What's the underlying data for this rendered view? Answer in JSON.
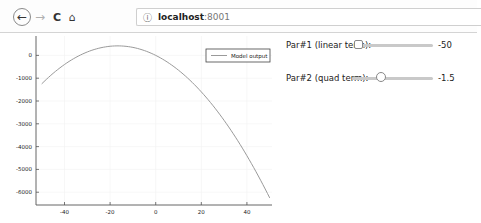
{
  "browser": {
    "url_host": "localhost",
    "url_port": ":8001",
    "icons": {
      "back": "←",
      "forward": "→",
      "reload": "C",
      "home": "⌂",
      "info": "ⓘ"
    }
  },
  "controls": [
    {
      "label": "Par#1 (linear term):",
      "value": "-50",
      "thumb_pos": 0.0
    },
    {
      "label": "Par#2 (quad term):",
      "value": "-1.5",
      "thumb_pos": 0.43
    }
  ],
  "chart_data": {
    "type": "line",
    "title": "",
    "xlabel": "",
    "ylabel": "",
    "xlim": [
      -52.5,
      51
    ],
    "ylim": [
      -6560,
      850
    ],
    "x_ticks": [
      -40,
      -20,
      0,
      20,
      40
    ],
    "x_tick_labels": [
      "-40",
      "-20",
      "0",
      "20",
      "40"
    ],
    "y_ticks": [
      0,
      -1000,
      -2000,
      -3000,
      -4000,
      -5000,
      -6000
    ],
    "y_tick_labels": [
      "0",
      "-1000",
      "-2000",
      "-3000",
      "-4000",
      "-5000",
      "-6000"
    ],
    "grid": true,
    "legend_position": "upper right",
    "series": [
      {
        "name": "Model output",
        "color": "#9a9a9a",
        "formula": "y = -1.5*x^2 - 50*x",
        "x": [
          -50,
          -40,
          -30,
          -20,
          -16.67,
          -10,
          0,
          10,
          20,
          30,
          40,
          50
        ],
        "y": [
          -1250,
          -400,
          150,
          400,
          416.7,
          350,
          0,
          -650,
          -1600,
          -2850,
          -4400,
          -6250
        ]
      }
    ]
  }
}
